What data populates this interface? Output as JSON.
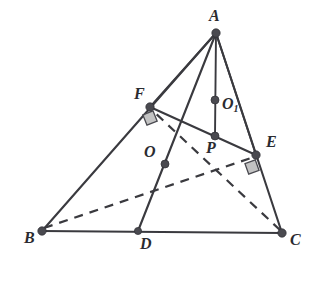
{
  "figure": {
    "width": 328,
    "height": 281,
    "background": "#ffffff",
    "line_color": "#3a3a3f",
    "dot_color": "#4a4a50",
    "right_angle_fill": "#b9b9b9",
    "label_color": "#2b2b30"
  },
  "points": [
    {
      "id": "A",
      "label": "A",
      "sub": "",
      "x": 216,
      "y": 33,
      "label_x": 209,
      "label_y": 8,
      "dot_r": 4.2
    },
    {
      "id": "F",
      "label": "F",
      "sub": "",
      "x": 150,
      "y": 107,
      "label_x": 134,
      "label_y": 86,
      "dot_r": 4.2
    },
    {
      "id": "E",
      "label": "E",
      "sub": "",
      "x": 256,
      "y": 155,
      "label_x": 266,
      "label_y": 134,
      "dot_r": 4.2
    },
    {
      "id": "B",
      "label": "B",
      "sub": "",
      "x": 42,
      "y": 231,
      "label_x": 24,
      "label_y": 230,
      "dot_r": 4.2
    },
    {
      "id": "D",
      "label": "D",
      "sub": "",
      "x": 138,
      "y": 231,
      "label_x": 140,
      "label_y": 236,
      "dot_r": 3.6
    },
    {
      "id": "C",
      "label": "C",
      "sub": "",
      "x": 282,
      "y": 233,
      "label_x": 290,
      "label_y": 232,
      "dot_r": 4.2
    },
    {
      "id": "O1",
      "label": "O",
      "sub": "1",
      "x": 215,
      "y": 100,
      "label_x": 222,
      "label_y": 96,
      "dot_r": 4.0
    },
    {
      "id": "P",
      "label": "P",
      "sub": "",
      "x": 215,
      "y": 136,
      "label_x": 206,
      "label_y": 140,
      "dot_r": 4.0
    },
    {
      "id": "O",
      "label": "O",
      "sub": "",
      "x": 165,
      "y": 164,
      "label_x": 144,
      "label_y": 144,
      "dot_r": 4.0
    }
  ],
  "segments": [
    {
      "id": "B-F-A",
      "from": "B",
      "to": "A",
      "style": "solid",
      "note": "edge AB passing through F"
    },
    {
      "id": "A-E-C",
      "from": "A",
      "to": "C",
      "style": "solid",
      "note": "edge AC passing through E"
    },
    {
      "id": "B-D-C",
      "from": "B",
      "to": "C",
      "style": "solid",
      "note": "base edge BC through D"
    },
    {
      "id": "F-E",
      "from": "F",
      "to": "E",
      "style": "solid",
      "note": "segment FE"
    },
    {
      "id": "A-O-D",
      "from": "A",
      "to": "D",
      "style": "solid",
      "note": "median AD passing through O"
    },
    {
      "id": "A-O1-P",
      "from": "A",
      "to": "P",
      "style": "solid",
      "note": "altitude A to P through O1"
    },
    {
      "id": "B-E",
      "from": "B",
      "to": "E",
      "style": "dashed",
      "note": "hidden line BE"
    },
    {
      "id": "C-F",
      "from": "C",
      "to": "F",
      "style": "dashed",
      "note": "hidden line CF"
    }
  ],
  "right_angles": [
    {
      "id": "right-angle-at-F",
      "x": 150,
      "y": 118,
      "size": 11,
      "rotate": -22,
      "note": "right angle marker near F"
    },
    {
      "id": "right-angle-at-E",
      "x": 252,
      "y": 167,
      "size": 11,
      "rotate": -20,
      "note": "right angle marker near E"
    }
  ]
}
